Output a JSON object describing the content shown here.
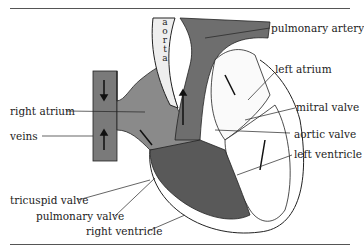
{
  "diagram": {
    "title_fragment": "",
    "labels": {
      "aorta": "a o r t a",
      "pulmonary_artery": "pulmonary artery",
      "left_atrium": "left atrium",
      "mitral_valve": "mitral valve",
      "aortic_valve": "aortic valve",
      "left_ventricle": "left ventricle",
      "right_atrium": "right atrium",
      "veins": "veins",
      "tricuspid_valve": "tricuspid valve",
      "pulmonary_valve": "pulmonary valve",
      "right_ventricle": "right ventricle"
    },
    "colors": {
      "dark_fill": "#6e6e6e",
      "mid_fill": "#8a8a8a",
      "line": "#222222",
      "paper": "#ffffff"
    }
  }
}
